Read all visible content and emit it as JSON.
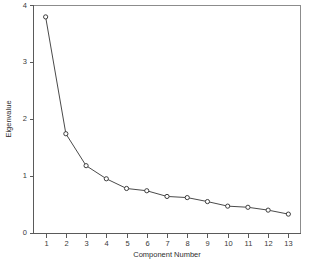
{
  "chart_data": {
    "type": "line",
    "title": "",
    "subtitle": "",
    "xlabel": "Component Number",
    "ylabel": "Eigenvalue",
    "x": [
      1,
      2,
      3,
      4,
      5,
      6,
      7,
      8,
      9,
      10,
      11,
      12,
      13
    ],
    "values": [
      3.8,
      1.75,
      1.19,
      0.96,
      0.79,
      0.75,
      0.65,
      0.63,
      0.56,
      0.48,
      0.46,
      0.41,
      0.34
    ],
    "series": [
      {
        "name": "Eigenvalue",
        "values": [
          3.8,
          1.75,
          1.19,
          0.96,
          0.79,
          0.75,
          0.65,
          0.63,
          0.56,
          0.48,
          0.46,
          0.41,
          0.34
        ]
      }
    ],
    "categories": [
      "1",
      "2",
      "3",
      "4",
      "5",
      "6",
      "7",
      "8",
      "9",
      "10",
      "11",
      "12",
      "13"
    ],
    "xlim": [
      0.4,
      13.6
    ],
    "ylim": [
      0,
      4
    ],
    "xticks": [
      1,
      2,
      3,
      4,
      5,
      6,
      7,
      8,
      9,
      10,
      11,
      12,
      13
    ],
    "xtick_labels": [
      "1",
      "2",
      "3",
      "4",
      "5",
      "6",
      "7",
      "8",
      "9",
      "10",
      "11",
      "12",
      "13"
    ],
    "yticks": [
      0,
      1,
      2,
      3,
      4
    ],
    "ytick_labels": [
      "0",
      "1",
      "2",
      "3",
      "4"
    ],
    "grid": false,
    "legend": false,
    "legend_position": "none",
    "marker": "open-circle",
    "line_color": "#4a4a4a",
    "marker_fill": "#ffffff",
    "marker_stroke": "#3d3d3d",
    "background": "#ffffff",
    "annotations": []
  },
  "axes": {
    "x_title": "Component Number",
    "y_title": "Eigenvalue"
  }
}
